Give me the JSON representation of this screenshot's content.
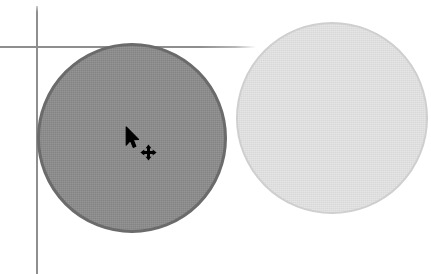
{
  "canvas": {
    "title": "Canvas Shape Drag",
    "width": 431,
    "height": 274,
    "background_color": "#ffffff"
  },
  "guides": {
    "vertical": {
      "label": "vertical guide line",
      "x": 37,
      "color": "#8e8e8e"
    },
    "horizontal": {
      "label": "horizontal guide line",
      "y": 47,
      "color": "#8e8e8e"
    }
  },
  "shapes": [
    {
      "name": "dark-circle",
      "type": "circle",
      "state": "selected",
      "center_x": 132,
      "center_y": 138,
      "radius": 95,
      "fill_color": "#8a8a8a",
      "stroke_color": "#6b6b6b"
    },
    {
      "name": "light-circle",
      "type": "circle",
      "state": "unselected",
      "center_x": 332,
      "center_y": 118,
      "radius": 96,
      "fill_color": "#e3e3e3",
      "stroke_color": "#cfcfcf"
    }
  ],
  "cursor": {
    "pointer_icon": "mouse-pointer-icon",
    "badge_icon": "move-four-arrows-icon",
    "x": 127,
    "y": 128,
    "color": "#000000",
    "mode": "move"
  }
}
